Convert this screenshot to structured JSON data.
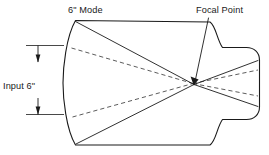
{
  "diagram": {
    "type": "technical-line-drawing",
    "title_label": "6\" Mode",
    "labels": {
      "mode": "6\" Mode",
      "focal_point": "Focal Point",
      "input_dimension": "Input 6\""
    },
    "colors": {
      "background": "#ffffff",
      "line": "#1a1a1a",
      "dashed_line": "#4a4a4a"
    },
    "annotations": {
      "mode_label": {
        "text": "6\" Mode",
        "x": 68,
        "y": 13
      },
      "focal_point_label": {
        "text": "Focal Point",
        "x": 196,
        "y": 13
      },
      "input_label": {
        "text": "Input 6\"",
        "x": 4,
        "y": 89
      }
    },
    "geometry": {
      "body_outline": "M 75.5 20.5 L 210 22 C 216 26 217 40 222.5 47.5 L 246.5 47.5 C 254 47.5 259.5 52.5 259.5 60 L 259.5 107 C 259.5 114.5 254 119.5 246.5 119.5 L 222.5 119.5 C 217 127 216 141 210 145 L 75.5 145 C 66 129 63 98 63 83 C 63 68 66 37 75.5 20.5 Z",
      "rays_solid": [
        {
          "from": [
            75.5,
            21.5
          ],
          "to": [
            194,
            84.5
          ]
        },
        {
          "from": [
            76.0,
            144.0
          ],
          "to": [
            194,
            84.5
          ]
        },
        {
          "from": [
            194,
            84.5
          ],
          "to": [
            258,
            60.5
          ]
        },
        {
          "from": [
            194,
            84.5
          ],
          "to": [
            258,
            106.5
          ]
        }
      ],
      "rays_dashed": [
        {
          "from": [
            71.5,
            48.0
          ],
          "to": [
            193,
            83.5
          ]
        },
        {
          "from": [
            72.5,
            117.0
          ],
          "to": [
            193,
            83.5
          ]
        },
        {
          "from": [
            193,
            83.5
          ],
          "to": [
            258,
            70.0
          ]
        },
        {
          "from": [
            193,
            83.5
          ],
          "to": [
            258,
            96.0
          ]
        }
      ],
      "focal_point": [
        193.5,
        84.0
      ],
      "leader_line": {
        "from": [
          208.5,
          18.0
        ],
        "to": [
          194.5,
          81.0
        ]
      },
      "dimension": {
        "x": 38,
        "top_y": 45,
        "bottom_y": 114,
        "ext_top": {
          "x1": 26,
          "x2": 63,
          "y": 45
        },
        "ext_bottom": {
          "x1": 26,
          "x2": 63,
          "y": 114
        }
      }
    }
  }
}
